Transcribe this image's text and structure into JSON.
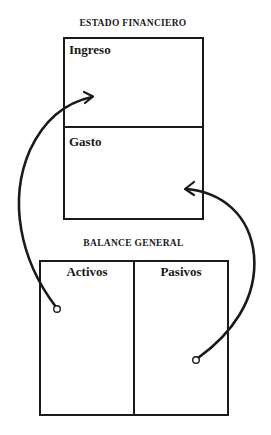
{
  "diagram": {
    "financial_statement": {
      "title": "ESTADO FINANCIERO",
      "sections": [
        {
          "label": "Ingreso"
        },
        {
          "label": "Gasto"
        }
      ]
    },
    "balance_sheet": {
      "title": "BALANCE GENERAL",
      "columns": [
        {
          "label": "Activos"
        },
        {
          "label": "Pasivos"
        }
      ]
    },
    "connectors": [
      {
        "from": "Activos",
        "to": "Ingreso",
        "style": "curved-arrow"
      },
      {
        "from": "Pasivos",
        "to": "Gasto",
        "style": "curved-arrow"
      }
    ],
    "colors": {
      "line": "#1a1a1a",
      "background": "#ffffff"
    }
  }
}
